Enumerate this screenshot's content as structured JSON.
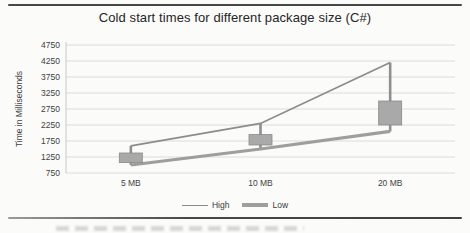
{
  "chart_data": {
    "type": "line",
    "variant": "high-low lines with up-down bars",
    "title": "Cold start times for different package size (C#)",
    "categories": [
      "5 MB",
      "10 MB",
      "20 MB"
    ],
    "series": [
      {
        "name": "High",
        "values": [
          1600,
          2300,
          4200
        ],
        "color": "#8c8c8c",
        "stroke_width": 1.7
      },
      {
        "name": "Low",
        "values": [
          1000,
          1500,
          2050
        ],
        "color": "#9e9e9e",
        "stroke_width": 3.2
      }
    ],
    "up_down_bars": [
      {
        "category": "5 MB",
        "from": 1075,
        "to": 1375
      },
      {
        "category": "10 MB",
        "from": 1625,
        "to": 1950
      },
      {
        "category": "20 MB",
        "from": 2250,
        "to": 3000
      }
    ],
    "bar_fill": "#a9a9a9",
    "bar_stroke": "#8a8a8a",
    "connector_color": "#8f8f8f",
    "gridline_color": "#dcdcdc",
    "axis_color": "#c8c8c8",
    "xlabel": "",
    "ylabel": "Time in Milliseconds",
    "ylim": [
      750,
      4750
    ],
    "ytick_step": 500,
    "yticks": [
      4750,
      4250,
      3750,
      3250,
      2750,
      2250,
      1750,
      1250,
      750
    ],
    "grid": true,
    "legend_position": "bottom"
  }
}
